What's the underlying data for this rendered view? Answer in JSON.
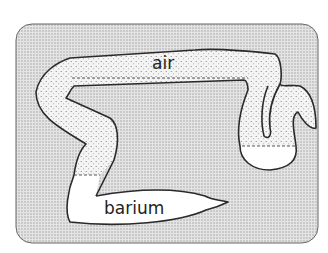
{
  "diagram": {
    "type": "schematic",
    "labels": {
      "air": "air",
      "barium": "barium"
    },
    "regions": [
      {
        "name": "air",
        "fill": "stippled"
      },
      {
        "name": "barium",
        "fill": "white"
      }
    ],
    "colors": {
      "background_panel": "#d9d9d9",
      "outline": "#2a2a2a",
      "air_fill": "#ececec",
      "barium_fill": "#ffffff"
    }
  }
}
